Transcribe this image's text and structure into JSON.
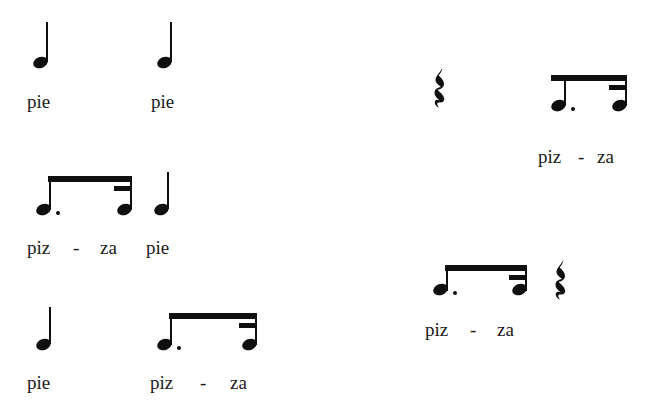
{
  "page": {
    "background_color": "#ffffff",
    "ink_color": "#100f10",
    "text_color": "#1b1a1b",
    "width": 655,
    "height": 414
  },
  "syllables": {
    "pie": "pie",
    "piz": "piz",
    "za": "za",
    "hyphen": "-"
  },
  "cells": [
    {
      "id": "cell-1",
      "position": "top-left",
      "notes": [
        {
          "type": "quarter-note",
          "lyric": "pie"
        },
        {
          "type": "quarter-note",
          "lyric": "pie"
        }
      ]
    },
    {
      "id": "cell-2",
      "position": "top-right",
      "notes": [
        {
          "type": "quarter-rest",
          "lyric": ""
        },
        {
          "type": "dotted-eighth-note",
          "lyric": "piz"
        },
        {
          "type": "sixteenth-note",
          "lyric": "za"
        }
      ]
    },
    {
      "id": "cell-3",
      "position": "middle-left",
      "notes": [
        {
          "type": "dotted-eighth-note",
          "lyric": "piz"
        },
        {
          "type": "sixteenth-note",
          "lyric": "za"
        },
        {
          "type": "quarter-note",
          "lyric": "pie"
        }
      ]
    },
    {
      "id": "cell-4",
      "position": "middle-right",
      "notes": [
        {
          "type": "dotted-eighth-note",
          "lyric": "piz"
        },
        {
          "type": "sixteenth-note",
          "lyric": "za"
        },
        {
          "type": "quarter-rest",
          "lyric": ""
        }
      ]
    },
    {
      "id": "cell-5",
      "position": "bottom-left",
      "notes": [
        {
          "type": "quarter-note",
          "lyric": "pie"
        },
        {
          "type": "dotted-eighth-note",
          "lyric": "piz"
        },
        {
          "type": "sixteenth-note",
          "lyric": "za"
        }
      ]
    }
  ]
}
